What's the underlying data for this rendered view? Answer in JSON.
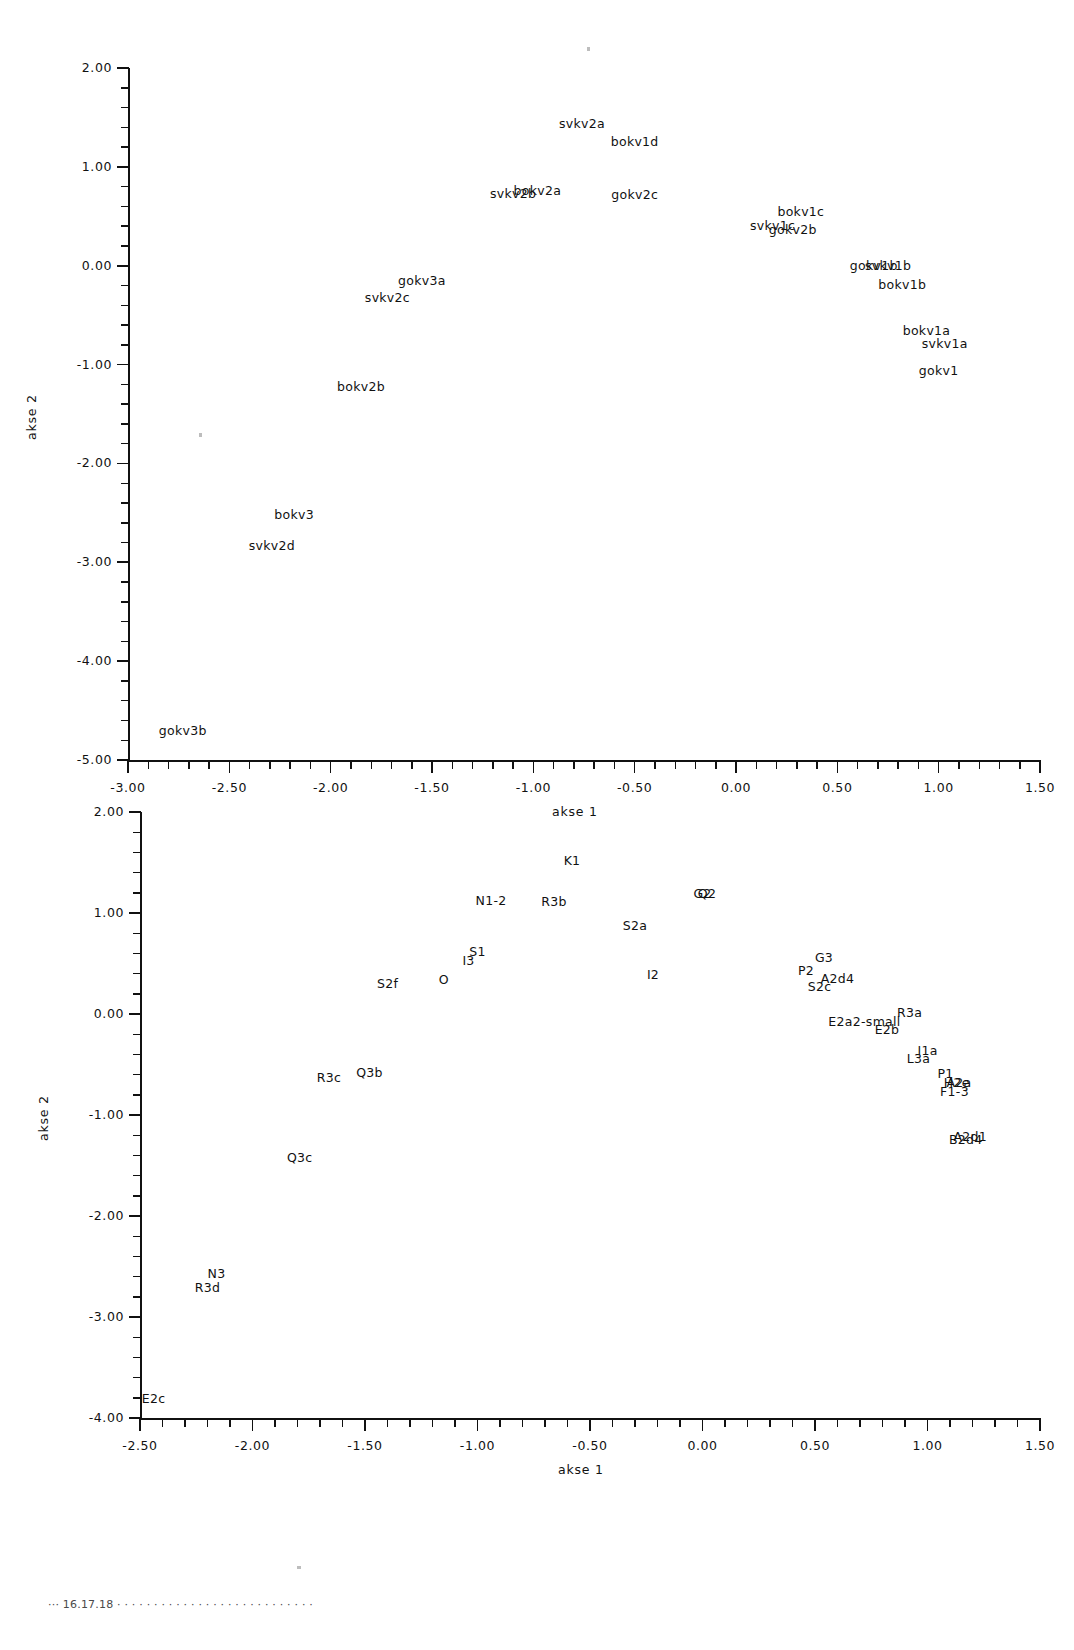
{
  "figure": {
    "background": "#ffffff",
    "ink_color": "#111111"
  },
  "charts": [
    {
      "id": "top-plot",
      "name": "scatter-plot-top",
      "xlabel": "akse 1",
      "ylabel": "akse 2",
      "xticks": [
        "-3.00",
        "-2.50",
        "-2.00",
        "-1.50",
        "-1.00",
        "-0.50",
        "0.00",
        "0.50",
        "1.00",
        "1.50"
      ],
      "yticks": [
        "2.00",
        "1.00",
        "0.00",
        "-1.00",
        "-2.00",
        "-3.00",
        "-4.00",
        "-5.00"
      ],
      "xtick_values": [
        -3.0,
        -2.5,
        -2.0,
        -1.5,
        -1.0,
        -0.5,
        0.0,
        0.5,
        1.0,
        1.5
      ],
      "ytick_values": [
        2.0,
        1.0,
        0.0,
        -1.0,
        -2.0,
        -3.0,
        -4.0,
        -5.0
      ],
      "xlim": [
        -3.0,
        1.5
      ],
      "ylim": [
        -5.0,
        2.0
      ],
      "minor_ticks_per_interval_x": 5,
      "minor_ticks_per_interval_y": 5,
      "grid": false,
      "points": [
        {
          "label": "svkv2a",
          "x": -0.76,
          "y": 1.44
        },
        {
          "label": "bokv1d",
          "x": -0.5,
          "y": 1.26
        },
        {
          "label": "svkv2b",
          "x": -1.1,
          "y": 0.74
        },
        {
          "label": "bokv2a",
          "x": -0.98,
          "y": 0.77
        },
        {
          "label": "gokv2c",
          "x": -0.5,
          "y": 0.73
        },
        {
          "label": "bokv1c",
          "x": 0.32,
          "y": 0.55
        },
        {
          "label": "svkv1c",
          "x": 0.18,
          "y": 0.41
        },
        {
          "label": "gokv2b",
          "x": 0.28,
          "y": 0.37
        },
        {
          "label": "gokv3a",
          "x": -1.55,
          "y": -0.14
        },
        {
          "label": "gokv1b",
          "x": 0.68,
          "y": 0.01
        },
        {
          "label": "svkv1b",
          "x": 0.75,
          "y": 0.01
        },
        {
          "label": "svkv2c",
          "x": -1.72,
          "y": -0.32
        },
        {
          "label": "bokv1b",
          "x": 0.82,
          "y": -0.19
        },
        {
          "label": "bokv1a",
          "x": 0.94,
          "y": -0.65
        },
        {
          "label": "svkv1a",
          "x": 1.03,
          "y": -0.78
        },
        {
          "label": "bokv2b",
          "x": -1.85,
          "y": -1.22
        },
        {
          "label": "gokv1",
          "x": 1.0,
          "y": -1.05
        },
        {
          "label": "bokv3",
          "x": -2.18,
          "y": -2.51
        },
        {
          "label": "svkv2d",
          "x": -2.29,
          "y": -2.83
        },
        {
          "label": "gokv3b",
          "x": -2.73,
          "y": -4.7
        }
      ]
    },
    {
      "id": "bottom-plot",
      "name": "scatter-plot-bottom",
      "xlabel": "akse 1",
      "ylabel": "akse 2",
      "xticks": [
        "-2.50",
        "-2.00",
        "-1.50",
        "-1.00",
        "-0.50",
        "0.00",
        "0.50",
        "1.00",
        "1.50"
      ],
      "yticks": [
        "2.00",
        "1.00",
        "0.00",
        "-1.00",
        "-2.00",
        "-3.00",
        "-4.00"
      ],
      "xtick_values": [
        -2.5,
        -2.0,
        -1.5,
        -1.0,
        -0.5,
        0.0,
        0.5,
        1.0,
        1.5
      ],
      "ytick_values": [
        2.0,
        1.0,
        0.0,
        -1.0,
        -2.0,
        -3.0,
        -4.0
      ],
      "xlim": [
        -2.5,
        1.5
      ],
      "ylim": [
        -4.0,
        2.0
      ],
      "minor_ticks_per_interval_x": 5,
      "minor_ticks_per_interval_y": 5,
      "grid": false,
      "points": [
        {
          "label": "K1",
          "x": -0.58,
          "y": 1.52
        },
        {
          "label": "N1-2",
          "x": -0.94,
          "y": 1.13
        },
        {
          "label": "R3b",
          "x": -0.66,
          "y": 1.12
        },
        {
          "label": "G2",
          "x": 0.0,
          "y": 1.2
        },
        {
          "label": "Q2",
          "x": 0.02,
          "y": 1.2
        },
        {
          "label": "S2a",
          "x": -0.3,
          "y": 0.88
        },
        {
          "label": "S1",
          "x": -1.0,
          "y": 0.62
        },
        {
          "label": "I3",
          "x": -1.04,
          "y": 0.53
        },
        {
          "label": "G3",
          "x": 0.54,
          "y": 0.56
        },
        {
          "label": "P2",
          "x": 0.46,
          "y": 0.44
        },
        {
          "label": "A2d4",
          "x": 0.6,
          "y": 0.36
        },
        {
          "label": "I2",
          "x": -0.22,
          "y": 0.4
        },
        {
          "label": "S2c",
          "x": 0.52,
          "y": 0.28
        },
        {
          "label": "S2f",
          "x": -1.4,
          "y": 0.31
        },
        {
          "label": "O",
          "x": -1.15,
          "y": 0.35
        },
        {
          "label": "R3a",
          "x": 0.92,
          "y": 0.02
        },
        {
          "label": "E2a2-small",
          "x": 0.72,
          "y": -0.07
        },
        {
          "label": "E2b",
          "x": 0.82,
          "y": -0.15
        },
        {
          "label": "I1a",
          "x": 1.0,
          "y": -0.36
        },
        {
          "label": "L3a",
          "x": 0.96,
          "y": -0.44
        },
        {
          "label": "R3c",
          "x": -1.66,
          "y": -0.62
        },
        {
          "label": "Q3b",
          "x": -1.48,
          "y": -0.57
        },
        {
          "label": "P1",
          "x": 1.08,
          "y": -0.58
        },
        {
          "label": "A2a",
          "x": 1.14,
          "y": -0.67
        },
        {
          "label": "H2e",
          "x": 1.13,
          "y": -0.67
        },
        {
          "label": "F1-3",
          "x": 1.12,
          "y": -0.76
        },
        {
          "label": "Q3c",
          "x": -1.79,
          "y": -1.42
        },
        {
          "label": "A2d1",
          "x": 1.19,
          "y": -1.21
        },
        {
          "label": "B2d4",
          "x": 1.17,
          "y": -1.24
        },
        {
          "label": "N3",
          "x": -2.16,
          "y": -2.56
        },
        {
          "label": "R3d",
          "x": -2.2,
          "y": -2.7
        },
        {
          "label": "E2c",
          "x": -2.44,
          "y": -3.8
        }
      ]
    }
  ],
  "caption": {
    "text": "··· 16.17.18 · · · · · · · · · · · · · · · · · · · · · · · · · · ·"
  }
}
